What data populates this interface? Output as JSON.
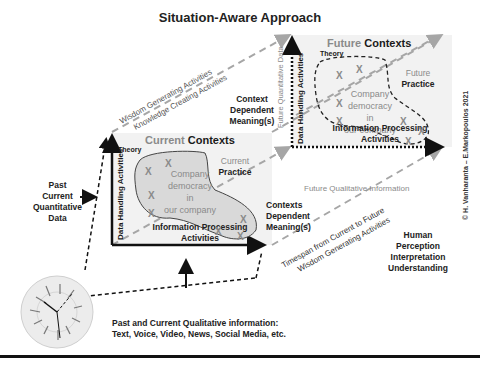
{
  "title": "Situation-Aware Approach",
  "current_context": {
    "title_light": "Current",
    "title_bold": "Contexts",
    "theory": "Theory",
    "practice_light": "Current",
    "practice_bold": "Practice",
    "center_lines": [
      "Company",
      "democracy",
      "in",
      "our company"
    ],
    "y_axis": "Data Handling Activities",
    "x_axis_lines": [
      "Information Processing",
      "Activities"
    ],
    "marker": "X"
  },
  "future_context": {
    "title_light": "Future",
    "title_bold": "Contexts",
    "theory": "Theory",
    "practice_light": "Future",
    "practice_bold": "Practice",
    "center_lines": [
      "Company",
      "democracy",
      "in",
      "our company"
    ],
    "y_axis": "Data Handling Activities",
    "x_axis_lines": [
      "Information Processing",
      "Activities"
    ],
    "marker": "X"
  },
  "labels": {
    "wisdom_top": "Wisdom Generating Activities",
    "knowledge_top": "Knowledge  Creating Activities",
    "context_dependent_top": [
      "Context",
      "Dependent",
      "Meaning(s)"
    ],
    "contexts_dependent_bottom": [
      "Contexts",
      "Dependent",
      "Meaning(s)"
    ],
    "future_quantitative": "Future Quantitative Data",
    "future_qualitative": "Future Qualitative Information",
    "timespan": "Timespan from Current to Future",
    "wisdom_bottom": "Wisdom Generating Activities",
    "human": [
      "Human",
      "Perception",
      "Interpretation",
      "Understanding"
    ],
    "past_quant": [
      "Past",
      "Current",
      "Quantitative",
      "Data"
    ],
    "past_qual": [
      "Past and Current Qualitative information:",
      "Text, Voice, Video, News, Social Media, etc."
    ],
    "copyright": "© H. Vanharanta – E.Markopoulos 2021"
  },
  "colors": {
    "box_fill": "#f2f2f2",
    "blob_fill": "#d9d9d9",
    "dashed_gray": "#a6a6a6",
    "text_dark": "#222222",
    "text_gray": "#8a8a8a"
  }
}
